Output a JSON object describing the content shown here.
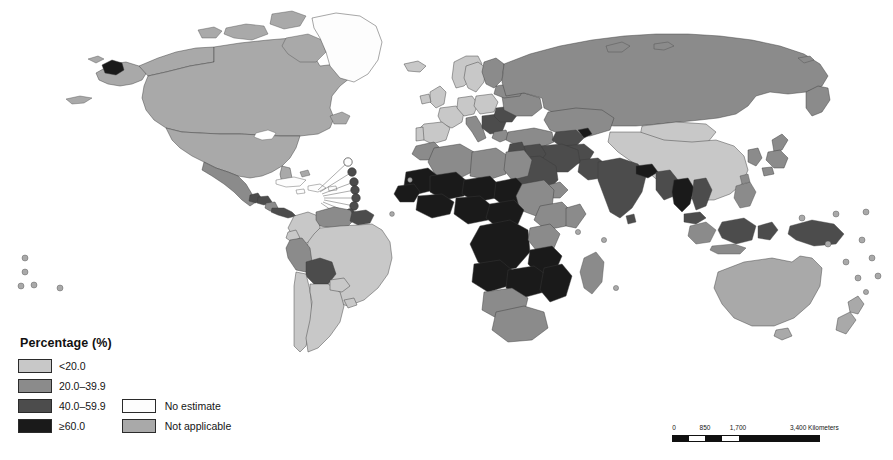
{
  "figure": {
    "type": "world-choropleth-map",
    "projection": "equirectangular"
  },
  "legend": {
    "title": "Percentage (%)",
    "classes": [
      {
        "label": "<20.0",
        "color": "#c8c8c8",
        "swatch_name": "legend-swatch-under-20"
      },
      {
        "label": "20.0–39.9",
        "color": "#8b8b8b",
        "swatch_name": "legend-swatch-20-39"
      },
      {
        "label": "40.0–59.9",
        "color": "#4c4c4c",
        "swatch_name": "legend-swatch-40-59"
      },
      {
        "label": "≥60.0",
        "color": "#1a1a1a",
        "swatch_name": "legend-swatch-60-plus"
      }
    ],
    "other": [
      {
        "label": "No estimate",
        "color": "#fdfdfd",
        "swatch_name": "legend-swatch-no-estimate"
      },
      {
        "label": "Not applicable",
        "color": "#a9a9a9",
        "swatch_name": "legend-swatch-not-applicable"
      }
    ]
  },
  "scalebar": {
    "ticks": [
      "0",
      "850",
      "1,700"
    ],
    "end_label": "3,400 Kilometers",
    "tick_0": "0",
    "tick_1": "850",
    "tick_2": "1,700",
    "tick_3": "3,400 Kilometers"
  },
  "map_colors": {
    "under20": "#c8c8c8",
    "mid20": "#8b8b8b",
    "mid40": "#4c4c4c",
    "over60": "#1a1a1a",
    "no_estimate": "#fdfdfd",
    "not_applicable": "#a9a9a9",
    "ocean": "#ffffff",
    "border": "#3a3a3a"
  }
}
